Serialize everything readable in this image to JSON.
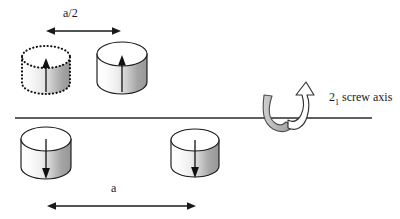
{
  "figure": {
    "type": "crystallographic-symmetry-diagram",
    "background_color": "#ffffff",
    "line_color": "#1a1a1a"
  },
  "labels": {
    "half_lattice": "a/2",
    "lattice": "a",
    "screw_axis_number": "2",
    "screw_axis_subscript": "1",
    "screw_axis_text": " screw axis"
  },
  "axis_line": {
    "name": "horizontal-axis-line",
    "x1": 15,
    "y1": 118,
    "x2": 372,
    "y2": 118,
    "color": "#2b2b2b"
  },
  "dimension_arrows": [
    {
      "name": "a-half-dimension-arrow",
      "label": "a/2",
      "x1": 47,
      "x2": 120,
      "y": 31,
      "double_headed": true
    },
    {
      "name": "a-dimension-arrow",
      "label": "a",
      "x1": 48,
      "x2": 195,
      "y": 206,
      "double_headed": true
    }
  ],
  "motifs": [
    {
      "name": "cylinder-top-left-ghost",
      "position": "above-axis",
      "cx": 46,
      "cy": 72,
      "rx": 24,
      "ry": 11,
      "body_height": 32,
      "outline": "dotted",
      "arrow_direction": "up",
      "fill_light": "#fdfdfd",
      "fill_dark": "#9a9a9a"
    },
    {
      "name": "cylinder-top-right-solid",
      "position": "above-axis",
      "cx": 122,
      "cy": 70,
      "rx": 25,
      "ry": 12,
      "body_height": 34,
      "outline": "solid",
      "arrow_direction": "up",
      "fill_light": "#ffffff",
      "fill_dark": "#9a9a9a"
    },
    {
      "name": "cylinder-bottom-left-solid",
      "position": "below-axis",
      "cx": 46,
      "cy": 155,
      "rx": 25,
      "ry": 12,
      "body_height": 34,
      "outline": "solid",
      "arrow_direction": "down",
      "fill_light": "#ffffff",
      "fill_dark": "#9a9a9a"
    },
    {
      "name": "cylinder-bottom-right-solid",
      "position": "below-axis",
      "cx": 195,
      "cy": 155,
      "rx": 24,
      "ry": 11,
      "body_height": 33,
      "outline": "solid",
      "arrow_direction": "down",
      "fill_light": "#ffffff",
      "fill_dark": "#9a9a9a"
    }
  ],
  "screw_symbol": {
    "name": "screw-axis-curved-arrow",
    "gray_band_color": "#b3b3b3",
    "gray_band_outline": "#4d4d4d",
    "arrow_fill": "#ffffff",
    "arrow_outline": "#333333"
  }
}
